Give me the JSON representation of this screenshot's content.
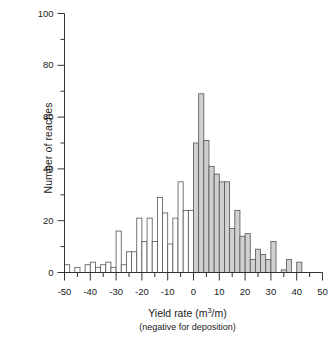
{
  "chart_data": {
    "type": "bar",
    "title": "",
    "subtitle": "",
    "xlabel": "Yield rate (m3/m)",
    "xlabel_parts": {
      "pre": "Yield rate (m",
      "sup": "3",
      "post": "/m)"
    },
    "xlabel_secondary": "(negative for deposition)",
    "ylabel": "Number of reaches",
    "xlim": [
      -50,
      50
    ],
    "ylim": [
      0,
      100
    ],
    "bin_width": 2,
    "grid": false,
    "legend": null,
    "xticks": [
      -50,
      -40,
      -30,
      -20,
      -10,
      0,
      10,
      20,
      30,
      40,
      50
    ],
    "xtick_labels": [
      "-50",
      "-40",
      "-30",
      "-20",
      "-10",
      "0",
      "10",
      "20",
      "30",
      "40",
      "50"
    ],
    "xminor_ticks": [
      -45,
      -35,
      -25,
      -15,
      -5,
      5,
      15,
      25,
      35,
      45
    ],
    "yticks": [
      0,
      20,
      40,
      60,
      80,
      100
    ],
    "ytick_labels": [
      "0",
      "20",
      "40",
      "60",
      "80",
      "100"
    ],
    "yminor_ticks": [
      10,
      30,
      50,
      70,
      90
    ],
    "bar_fill_negative": "#ffffff",
    "bar_fill_positive": "#d0d0d0",
    "bar_edge": "#555555",
    "axis_color": "#333333",
    "bins": [
      {
        "x0": -50,
        "x1": -48,
        "value": 3
      },
      {
        "x0": -48,
        "x1": -46,
        "value": 0
      },
      {
        "x0": -46,
        "x1": -44,
        "value": 2
      },
      {
        "x0": -44,
        "x1": -42,
        "value": 0
      },
      {
        "x0": -42,
        "x1": -40,
        "value": 3
      },
      {
        "x0": -40,
        "x1": -38,
        "value": 4
      },
      {
        "x0": -38,
        "x1": -36,
        "value": 2
      },
      {
        "x0": -36,
        "x1": -34,
        "value": 3
      },
      {
        "x0": -34,
        "x1": -32,
        "value": 4
      },
      {
        "x0": -32,
        "x1": -30,
        "value": 2
      },
      {
        "x0": -30,
        "x1": -28,
        "value": 16
      },
      {
        "x0": -28,
        "x1": -26,
        "value": 3
      },
      {
        "x0": -26,
        "x1": -24,
        "value": 8
      },
      {
        "x0": -24,
        "x1": -22,
        "value": 8
      },
      {
        "x0": -22,
        "x1": -20,
        "value": 21
      },
      {
        "x0": -20,
        "x1": -18,
        "value": 12
      },
      {
        "x0": -18,
        "x1": -16,
        "value": 21
      },
      {
        "x0": -16,
        "x1": -14,
        "value": 12
      },
      {
        "x0": -14,
        "x1": -12,
        "value": 29
      },
      {
        "x0": -12,
        "x1": -10,
        "value": 23
      },
      {
        "x0": -10,
        "x1": -8,
        "value": 11
      },
      {
        "x0": -8,
        "x1": -6,
        "value": 21
      },
      {
        "x0": -6,
        "x1": -4,
        "value": 35
      },
      {
        "x0": -4,
        "x1": -2,
        "value": 24
      },
      {
        "x0": -2,
        "x1": 0,
        "value": 24
      },
      {
        "x0": 0,
        "x1": 2,
        "value": 50
      },
      {
        "x0": 2,
        "x1": 4,
        "value": 69
      },
      {
        "x0": 4,
        "x1": 6,
        "value": 51
      },
      {
        "x0": 6,
        "x1": 8,
        "value": 41
      },
      {
        "x0": 8,
        "x1": 10,
        "value": 38
      },
      {
        "x0": 10,
        "x1": 12,
        "value": 35
      },
      {
        "x0": 12,
        "x1": 14,
        "value": 35
      },
      {
        "x0": 14,
        "x1": 16,
        "value": 17
      },
      {
        "x0": 16,
        "x1": 18,
        "value": 24
      },
      {
        "x0": 18,
        "x1": 20,
        "value": 14
      },
      {
        "x0": 20,
        "x1": 22,
        "value": 15
      },
      {
        "x0": 22,
        "x1": 24,
        "value": 5
      },
      {
        "x0": 24,
        "x1": 26,
        "value": 9
      },
      {
        "x0": 26,
        "x1": 28,
        "value": 7
      },
      {
        "x0": 28,
        "x1": 30,
        "value": 5
      },
      {
        "x0": 30,
        "x1": 32,
        "value": 12
      },
      {
        "x0": 32,
        "x1": 34,
        "value": 0
      },
      {
        "x0": 34,
        "x1": 36,
        "value": 1
      },
      {
        "x0": 36,
        "x1": 38,
        "value": 5
      },
      {
        "x0": 38,
        "x1": 40,
        "value": 0
      },
      {
        "x0": 40,
        "x1": 42,
        "value": 4
      },
      {
        "x0": 42,
        "x1": 44,
        "value": 0
      },
      {
        "x0": 44,
        "x1": 46,
        "value": 0
      },
      {
        "x0": 46,
        "x1": 48,
        "value": 0
      },
      {
        "x0": 48,
        "x1": 50,
        "value": 0
      }
    ]
  }
}
